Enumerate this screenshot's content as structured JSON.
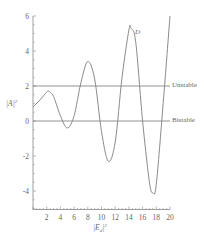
{
  "chart_data": {
    "type": "line",
    "title": "",
    "xlabel": "|E_d|^2",
    "ylabel": "|A|^2",
    "xlim": [
      0,
      20
    ],
    "ylim": [
      -5,
      6
    ],
    "x_ticks": [
      2,
      4,
      6,
      8,
      10,
      12,
      14,
      16,
      18,
      20
    ],
    "y_ticks": [
      -4,
      -2,
      0,
      2,
      4,
      6
    ],
    "grid": false,
    "legend": null,
    "series": [
      {
        "name": "D",
        "x": [
          0,
          1,
          2,
          2.3,
          3,
          4,
          5,
          6,
          7,
          8,
          9,
          10,
          11,
          12,
          13,
          14,
          14.3,
          15,
          16,
          17,
          17.5,
          18,
          19,
          20
        ],
        "values": [
          0.8,
          1.2,
          1.65,
          1.7,
          1.4,
          0.3,
          -0.4,
          0.3,
          2.2,
          3.4,
          2.4,
          -0.6,
          -2.3,
          -1.2,
          2.5,
          5.2,
          5.3,
          4.5,
          0.0,
          -3.5,
          -4.1,
          -3.6,
          1.0,
          6.0
        ]
      }
    ],
    "reference_lines": [
      {
        "y": 2,
        "label": "Unstable"
      },
      {
        "y": 0,
        "label": "Bistable"
      }
    ],
    "annotations": [
      {
        "text": "D",
        "x": 14.9,
        "y": 5.1
      }
    ]
  },
  "labels": {
    "xlabel_main": "|E",
    "xlabel_sub": "d",
    "xlabel_sup": "2",
    "ylabel_main": "|A|",
    "ylabel_sup": "2",
    "ref_unstable": "Unstable",
    "ref_bistable": "Bistable",
    "curve_label": "D"
  },
  "colors": {
    "curve": "#8a8a8a",
    "axis": "#888888",
    "reference_line": "#777777"
  }
}
